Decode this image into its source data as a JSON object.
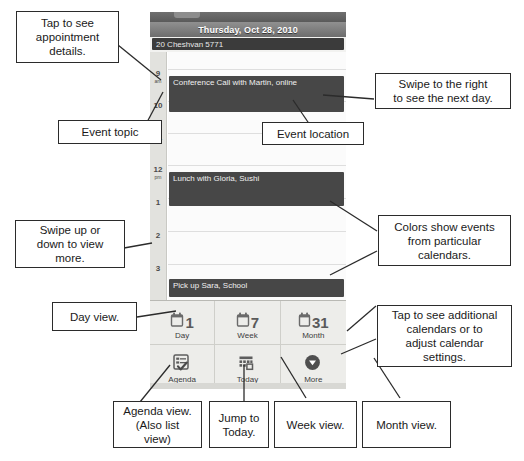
{
  "phone": {
    "titlebar": {
      "date": "Thursday, Oct 28, 2010"
    },
    "subtitle": {
      "text": "20 Cheshvan 5771"
    },
    "hours": [
      {
        "num": "9",
        "mer": "am"
      },
      {
        "num": "10",
        "mer": ""
      },
      {
        "num": "11",
        "mer": ""
      },
      {
        "num": "12",
        "mer": "pm"
      },
      {
        "num": "1",
        "mer": ""
      },
      {
        "num": "2",
        "mer": ""
      },
      {
        "num": "3",
        "mer": ""
      }
    ],
    "events": [
      {
        "title": "Conference Call with Martin, online"
      },
      {
        "title": "Lunch with Gloria, Sushi"
      },
      {
        "title": "Pick up Sara, School"
      }
    ],
    "toolbar": [
      {
        "label": "Day",
        "icon": "calendar-1-icon",
        "num": "1"
      },
      {
        "label": "Week",
        "icon": "calendar-7-icon",
        "num": "7"
      },
      {
        "label": "Month",
        "icon": "calendar-31-icon",
        "num": "31"
      },
      {
        "label": "Agenda",
        "icon": "agenda-list-icon",
        "num": ""
      },
      {
        "label": "Today",
        "icon": "today-grid-icon",
        "num": ""
      },
      {
        "label": "More",
        "icon": "chevron-down-circle-icon",
        "num": ""
      }
    ]
  },
  "annotations": [
    {
      "id": "tap-appointment-details",
      "text": "Tap to see\nappointment\ndetails."
    },
    {
      "id": "event-topic",
      "text": "Event topic"
    },
    {
      "id": "swipe-right-next-day",
      "text": "Swipe to the right\nto see the next day."
    },
    {
      "id": "event-location",
      "text": "Event location"
    },
    {
      "id": "swipe-up-down",
      "text": "Swipe up or\ndown to view\nmore."
    },
    {
      "id": "colors-show-events",
      "text": "Colors show events\nfrom  particular\ncalendars."
    },
    {
      "id": "day-view",
      "text": "Day view."
    },
    {
      "id": "tap-additional-calendars",
      "text": "Tap to see additional\ncalendars or to\nadjust calendar\nsettings."
    },
    {
      "id": "agenda-view",
      "text": "Agenda view.\n(Also list\nview)"
    },
    {
      "id": "jump-to-today",
      "text": "Jump to\nToday."
    },
    {
      "id": "week-view",
      "text": "Week view."
    },
    {
      "id": "month-view",
      "text": "Month view."
    }
  ],
  "colors": {
    "event_block": "#474747",
    "titlebar": "#7d7d7d",
    "subtitle_bar": "#3b3b3b",
    "gutter": "#e2e2de",
    "callout_border": "#2b2b2b"
  }
}
